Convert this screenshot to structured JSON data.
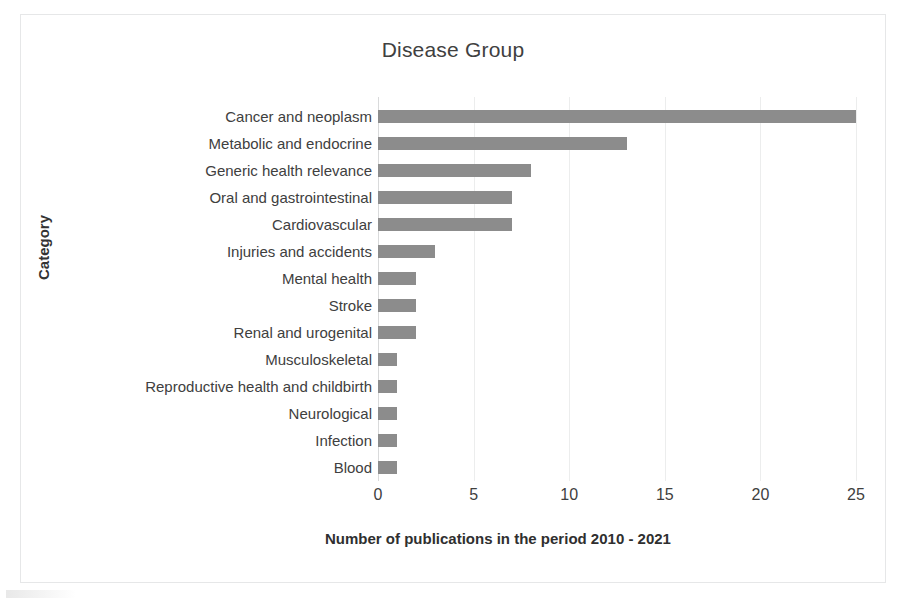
{
  "chart_data": {
    "type": "bar",
    "orientation": "horizontal",
    "title": "Disease Group",
    "xlabel": "Number of publications in the period 2010 - 2021",
    "ylabel": "Category",
    "xlim": [
      0,
      25
    ],
    "xticks": [
      0,
      5,
      10,
      15,
      20,
      25
    ],
    "xtick_labels": [
      "0",
      "5",
      "10",
      "15",
      "20",
      "25"
    ],
    "grid": true,
    "grid_axis": "x",
    "legend": false,
    "bar_color": "#8c8c8c",
    "categories": [
      "Cancer and neoplasm",
      "Metabolic and endocrine",
      "Generic health relevance",
      "Oral and gastrointestinal",
      "Cardiovascular",
      "Injuries and accidents",
      "Mental health",
      "Stroke",
      "Renal and urogenital",
      "Musculoskeletal",
      "Reproductive health and childbirth",
      "Neurological",
      "Infection",
      "Blood"
    ],
    "values": [
      25,
      13,
      8,
      7,
      7,
      3,
      2,
      2,
      2,
      1,
      1,
      1,
      1,
      1
    ]
  }
}
